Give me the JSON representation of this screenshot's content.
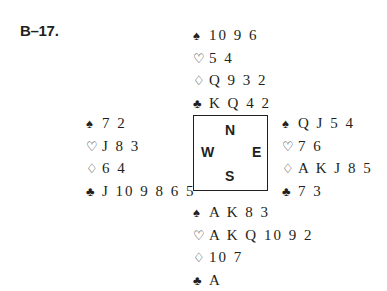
{
  "problem_label": "B–17.",
  "compass": {
    "north": "N",
    "west": "W",
    "east": "E",
    "south": "S"
  },
  "suits": {
    "spades": "♠",
    "hearts": "♡",
    "diamonds": "♢",
    "clubs": "♣"
  },
  "hands": {
    "north": {
      "spades": "10 9 6",
      "hearts": "5 4",
      "diamonds": "Q 9 3 2",
      "clubs": "K Q 4 2"
    },
    "west": {
      "spades": "7 2",
      "hearts": "J 8 3",
      "diamonds": "6 4",
      "clubs": "J 10 9 8 6 5"
    },
    "east": {
      "spades": "Q J 5 4",
      "hearts": "7 6",
      "diamonds": "A K J 8 5",
      "clubs": "7 3"
    },
    "south": {
      "spades": "A K 8 3",
      "hearts": "A K Q 10 9 2",
      "diamonds": "10 7",
      "clubs": "A"
    }
  }
}
